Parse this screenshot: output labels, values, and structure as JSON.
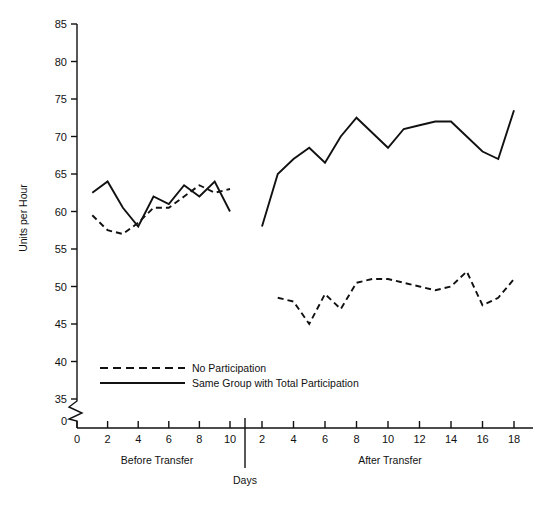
{
  "chart_data": {
    "type": "line",
    "title": "",
    "xlabel": "Days",
    "ylabel": "Units per Hour",
    "ylim": [
      35,
      85
    ],
    "y_break_below": 35,
    "y_zero_tick": "0",
    "yticks": [
      35,
      40,
      45,
      50,
      55,
      60,
      65,
      70,
      75,
      80,
      85
    ],
    "grid": false,
    "legend_position": "inside-lower-left",
    "panels": [
      {
        "name": "Before Transfer",
        "label": "Before Transfer",
        "xticks": [
          0,
          2,
          4,
          6,
          8,
          10
        ],
        "xlim": [
          0,
          10.5
        ],
        "series": [
          {
            "name": "No Participation",
            "style": "dashed",
            "x": [
              1,
              2,
              3,
              4,
              5,
              6,
              7,
              8,
              9,
              10
            ],
            "values": [
              59.5,
              57.5,
              57.0,
              58.5,
              60.5,
              60.5,
              62.0,
              63.5,
              62.5,
              63.0
            ]
          },
          {
            "name": "Same Group with Total Participation",
            "style": "solid",
            "x": [
              1,
              2,
              3,
              4,
              5,
              6,
              7,
              8,
              9,
              10
            ],
            "values": [
              62.5,
              64.0,
              60.5,
              58.0,
              62.0,
              61.0,
              63.5,
              62.0,
              64.0,
              60.0
            ]
          }
        ]
      },
      {
        "name": "After Transfer",
        "label": "After Transfer",
        "xticks": [
          2,
          4,
          6,
          8,
          10,
          12,
          14,
          16,
          18
        ],
        "xlim": [
          1.5,
          19
        ],
        "series": [
          {
            "name": "No Participation",
            "style": "dashed",
            "x": [
              3,
              4,
              5,
              6,
              7,
              8,
              9,
              10,
              11,
              12,
              13,
              14,
              15,
              16,
              17,
              18
            ],
            "values": [
              48.5,
              48.0,
              45.0,
              49.0,
              47.0,
              50.5,
              51.0,
              51.0,
              50.5,
              50.0,
              49.5,
              50.0,
              52.0,
              47.5,
              48.5,
              51.0
            ]
          },
          {
            "name": "Same Group with Total Participation",
            "style": "solid",
            "x": [
              2,
              3,
              4,
              5,
              6,
              7,
              8,
              9,
              10,
              11,
              12,
              13,
              14,
              15,
              16,
              17,
              18
            ],
            "values": [
              58.0,
              65.0,
              67.0,
              68.5,
              66.5,
              70.0,
              72.5,
              70.5,
              68.5,
              71.0,
              71.5,
              72.0,
              72.0,
              70.0,
              68.0,
              67.0,
              73.5
            ]
          }
        ]
      }
    ],
    "legend": [
      {
        "label": "No Participation",
        "style": "dashed"
      },
      {
        "label": "Same Group with Total Participation",
        "style": "solid"
      }
    ]
  },
  "axis": {
    "y_title": "Units per Hour",
    "x_title": "Days",
    "y_tick_labels": [
      "85",
      "80",
      "75",
      "70",
      "65",
      "60",
      "55",
      "50",
      "45",
      "40",
      "35",
      "0"
    ],
    "x_tick_labels_left": [
      "0",
      "2",
      "4",
      "6",
      "8",
      "10"
    ],
    "x_tick_labels_right": [
      "2",
      "4",
      "6",
      "8",
      "10",
      "12",
      "14",
      "16",
      "18"
    ]
  },
  "panel_labels": {
    "left": "Before Transfer",
    "right": "After Transfer"
  },
  "legend": {
    "item_dashed": "No Participation",
    "item_solid": "Same Group with Total Participation"
  },
  "colors": {
    "line": "#111111",
    "axis": "#111111",
    "background": "#ffffff"
  }
}
